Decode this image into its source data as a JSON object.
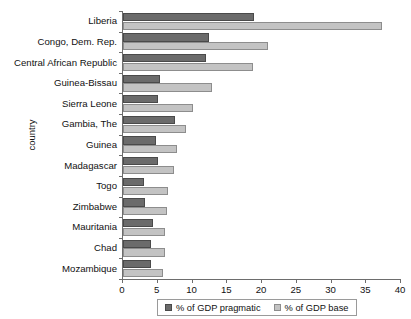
{
  "chart_data": {
    "type": "bar",
    "orientation": "horizontal",
    "title": "",
    "xlabel": "",
    "ylabel": "country",
    "xlim": [
      0,
      40
    ],
    "xticks": [
      0,
      5,
      10,
      15,
      20,
      25,
      30,
      35,
      40
    ],
    "grid": false,
    "legend_position": "bottom",
    "categories": [
      "Liberia",
      "Congo, Dem. Rep.",
      "Central African Republic",
      "Guinea-Bissau",
      "Sierra Leone",
      "Gambia, The",
      "Guinea",
      "Madagascar",
      "Togo",
      "Zimbabwe",
      "Mauritania",
      "Chad",
      "Mozambique"
    ],
    "series": [
      {
        "name": "% of GDP pragmatic",
        "color": "#6b6b6b",
        "values": [
          18.9,
          12.4,
          12.0,
          5.3,
          5.0,
          7.5,
          4.8,
          5.1,
          3.0,
          3.2,
          4.3,
          4.0,
          4.0
        ]
      },
      {
        "name": "% of GDP base",
        "color": "#c3c3c3",
        "values": [
          37.3,
          20.8,
          18.7,
          12.8,
          10.0,
          9.0,
          7.7,
          7.4,
          6.5,
          6.3,
          6.1,
          6.0,
          5.8
        ]
      }
    ]
  }
}
